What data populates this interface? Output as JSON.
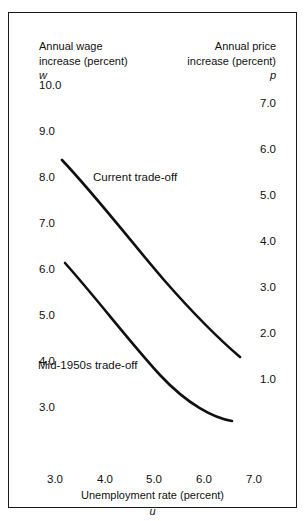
{
  "chart_data": {
    "type": "line",
    "title": "",
    "xlabel": "Unemployment rate (percent)",
    "xsymbol": "u",
    "ylabel_left": "Annual wage\nincrease (percent)",
    "ysymbol_left": "w",
    "ylabel_right": "Annual price\nincrease (percent)",
    "ysymbol_right": "p",
    "grid": false,
    "legend_position": "inline-annotation",
    "xlim": [
      3.0,
      7.0
    ],
    "ylim_left": [
      3.0,
      10.0
    ],
    "ylim_right": [
      1.0,
      7.0
    ],
    "xticks": [
      "3.0",
      "4.0",
      "5.0",
      "6.0",
      "7.0"
    ],
    "yticks_left": [
      "10.0",
      "9.0",
      "8.0",
      "7.0",
      "6.0",
      "5.0",
      "4.0",
      "3.0"
    ],
    "yticks_right": [
      "7.0",
      "6.0",
      "5.0",
      "4.0",
      "3.0",
      "2.0",
      "1.0"
    ],
    "series": [
      {
        "name": "Current trade-off",
        "x": [
          3.35,
          3.8,
          4.3,
          4.8,
          5.3,
          5.8,
          6.2,
          6.5
        ],
        "y": [
          8.05,
          7.55,
          7.0,
          6.5,
          6.05,
          5.6,
          5.3,
          5.05
        ],
        "annotation": "Current trade-off"
      },
      {
        "name": "Mid-1950s trade-off",
        "x": [
          3.4,
          3.9,
          4.4,
          4.9,
          5.4,
          5.9,
          6.3,
          6.5
        ],
        "y": [
          6.1,
          5.55,
          5.0,
          4.5,
          4.05,
          3.6,
          3.3,
          3.15
        ],
        "annotation": "Mid-1950s trade-off"
      }
    ]
  },
  "axes": {
    "left": {
      "title": "Annual wage\nincrease (percent)",
      "symbol": "w",
      "ticks": [
        {
          "label": "10.0",
          "y": 66
        },
        {
          "label": "9.0",
          "y": 112
        },
        {
          "label": "8.0",
          "y": 158
        },
        {
          "label": "7.0",
          "y": 204
        },
        {
          "label": "6.0",
          "y": 250
        },
        {
          "label": "5.0",
          "y": 296
        },
        {
          "label": "4.0",
          "y": 342
        },
        {
          "label": "3.0",
          "y": 388
        }
      ]
    },
    "right": {
      "title": "Annual price\nincrease (percent)",
      "symbol": "p",
      "ticks": [
        {
          "label": "7.0",
          "y": 84
        },
        {
          "label": "6.0",
          "y": 130
        },
        {
          "label": "5.0",
          "y": 176
        },
        {
          "label": "4.0",
          "y": 222
        },
        {
          "label": "3.0",
          "y": 268
        },
        {
          "label": "2.0",
          "y": 314
        },
        {
          "label": "1.0",
          "y": 360
        }
      ]
    },
    "bottom": {
      "title": "Unemployment rate (percent)",
      "symbol": "u",
      "ticks": [
        {
          "label": "3.0",
          "x": 46
        },
        {
          "label": "4.0",
          "x": 96
        },
        {
          "label": "5.0",
          "x": 145
        },
        {
          "label": "6.0",
          "x": 195
        },
        {
          "label": "7.0",
          "x": 245
        }
      ]
    }
  },
  "curves": {
    "current": {
      "label": "Current trade-off",
      "path": "M 62,160 C 96,196 128,238 164,280 C 192,312 220,340 240,357",
      "color": "#111111",
      "width": 2.6
    },
    "mid1950s": {
      "label": "Mid-1950s trade-off",
      "path": "M 65,263 C 98,300 128,340 160,375 C 188,405 214,418 232,421",
      "color": "#111111",
      "width": 2.6
    }
  },
  "style": {
    "border_color": "#1a1a1a",
    "background": "#ffffff",
    "text_color": "#111111"
  }
}
